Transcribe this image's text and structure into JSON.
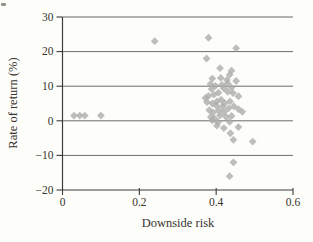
{
  "figure": {
    "background": "#fdfdfa",
    "marker_color": "#adadad",
    "marker_opacity": 0.8,
    "gridline_color": "#6f6b66",
    "axis_color": "#403c38",
    "text_color": "#38332d"
  },
  "chart_data": {
    "type": "scatter",
    "title": "",
    "xlabel": "Downside risk",
    "ylabel": "Rate of return (%)",
    "xlim": [
      0,
      0.6
    ],
    "ylim": [
      -20,
      30
    ],
    "x_ticks": [
      0,
      0.2,
      0.4,
      0.6
    ],
    "x_tick_labels": [
      "0",
      "0.2",
      "0.4",
      "0.6"
    ],
    "y_ticks": [
      -20,
      -10,
      0,
      10,
      20,
      30
    ],
    "y_tick_labels": [
      "−20",
      "−10",
      "0",
      "10",
      "20",
      "30"
    ],
    "grid": "horizontal",
    "legend": "none",
    "marker": "diamond",
    "points": [
      [
        0.24,
        23
      ],
      [
        0.38,
        24
      ],
      [
        0.452,
        21
      ],
      [
        0.375,
        18
      ],
      [
        0.03,
        1.5
      ],
      [
        0.045,
        1.5
      ],
      [
        0.058,
        1.5
      ],
      [
        0.1,
        1.5
      ],
      [
        0.445,
        -5.5
      ],
      [
        0.495,
        -6
      ],
      [
        0.445,
        -12
      ],
      [
        0.435,
        -16
      ],
      [
        0.41,
        15.2
      ],
      [
        0.44,
        14.5
      ],
      [
        0.435,
        13.3
      ],
      [
        0.39,
        12.2
      ],
      [
        0.412,
        12.4
      ],
      [
        0.428,
        11.8
      ],
      [
        0.452,
        11.5
      ],
      [
        0.385,
        10.6
      ],
      [
        0.398,
        10.1
      ],
      [
        0.415,
        10.4
      ],
      [
        0.43,
        10.8
      ],
      [
        0.388,
        9.2
      ],
      [
        0.42,
        9.4
      ],
      [
        0.44,
        9.6
      ],
      [
        0.372,
        6.6
      ],
      [
        0.38,
        7.2
      ],
      [
        0.394,
        7.6
      ],
      [
        0.406,
        8.1
      ],
      [
        0.43,
        8.4
      ],
      [
        0.444,
        8.0
      ],
      [
        0.458,
        7.1
      ],
      [
        0.376,
        5.4
      ],
      [
        0.39,
        5.0
      ],
      [
        0.402,
        5.6
      ],
      [
        0.413,
        6.1
      ],
      [
        0.422,
        5.1
      ],
      [
        0.436,
        5.6
      ],
      [
        0.4,
        4.4
      ],
      [
        0.416,
        4.1
      ],
      [
        0.446,
        4.2
      ],
      [
        0.382,
        3.1
      ],
      [
        0.392,
        2.4
      ],
      [
        0.406,
        3.0
      ],
      [
        0.421,
        2.6
      ],
      [
        0.432,
        3.6
      ],
      [
        0.458,
        3.4
      ],
      [
        0.468,
        2.6
      ],
      [
        0.386,
        1.1
      ],
      [
        0.396,
        0.6
      ],
      [
        0.41,
        1.6
      ],
      [
        0.426,
        1.1
      ],
      [
        0.44,
        1.4
      ],
      [
        0.39,
        0.1
      ],
      [
        0.405,
        -0.4
      ],
      [
        0.435,
        -0.3
      ],
      [
        0.402,
        -1.4
      ],
      [
        0.42,
        -2.1
      ],
      [
        0.458,
        -1.8
      ],
      [
        0.437,
        -3.6
      ]
    ]
  }
}
